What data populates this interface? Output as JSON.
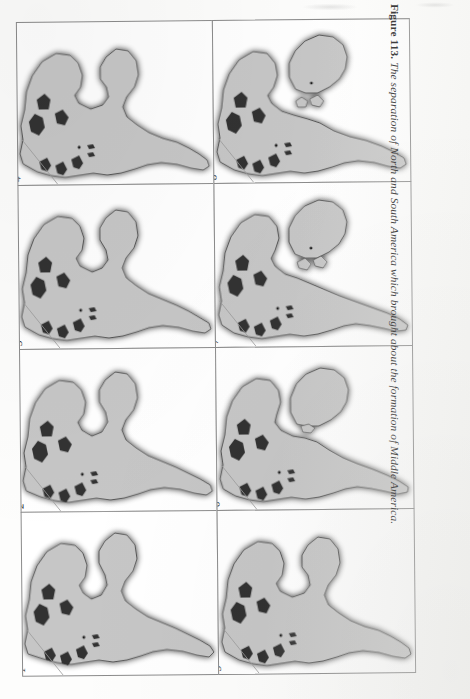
{
  "figure": {
    "caption_label": "Figure 113.",
    "caption_body": "The separation of North and South America which brought about the formation of Middle America.",
    "orientation": "rotated-90-landscape-on-portrait-page",
    "panel_count": 8,
    "columns": 2,
    "rows": 4,
    "colors": {
      "land_fill": "#c6c6c6",
      "shelf_dark": "#303030",
      "coastline": "#4a4a4a",
      "panel_border": "#8b8b8b",
      "page_background": "#fdfdfc",
      "caption_text": "#1b1b1b"
    },
    "panels": [
      {
        "number": "1",
        "stage_label": "1",
        "gap_width": 0,
        "note": "North and South America fully joined"
      },
      {
        "number": "2",
        "stage_label": "2",
        "gap_width": 0,
        "note": "still joined, slight rotation of South America"
      },
      {
        "number": "3",
        "stage_label": "3",
        "gap_width": 0,
        "note": "contact narrowing"
      },
      {
        "number": "4",
        "stage_label": "4",
        "gap_width": 0,
        "note": "narrow isthmus contact"
      },
      {
        "number": "5",
        "stage_label": "5",
        "gap_width": 1,
        "note": "initial thinning of the connection"
      },
      {
        "number": "6",
        "stage_label": "6",
        "gap_width": 4,
        "note": "narrow land bridge remnant"
      },
      {
        "number": "7",
        "stage_label": "7",
        "gap_width": 9,
        "note": "proto-Caribbean seaway opening"
      },
      {
        "number": "8",
        "stage_label": "8",
        "gap_width": 13,
        "note": "full separation, Middle America forming"
      }
    ],
    "column_order": [
      {
        "column": "left",
        "panels_bottom_to_top": [
          "1",
          "2",
          "3",
          "4"
        ]
      },
      {
        "column": "right",
        "panels_bottom_to_top": [
          "5",
          "6",
          "7",
          "8"
        ]
      }
    ]
  }
}
